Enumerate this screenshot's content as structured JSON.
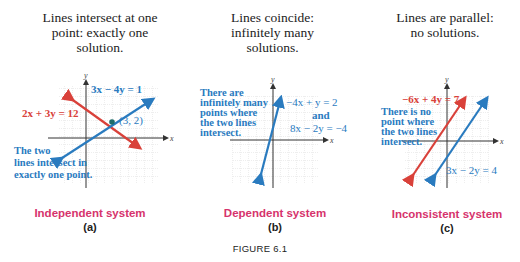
{
  "colors": {
    "red_line": "#d9413a",
    "blue_line": "#2a7bbf",
    "label_magenta": "#d6336c",
    "grid": "#bbbbbb",
    "text": "#222222"
  },
  "panels": [
    {
      "id": "a",
      "caption_lines": [
        "Lines intersect at one",
        "point: exactly one",
        "solution."
      ],
      "system_label": "Independent system",
      "sub_label": "(a)",
      "equations": [
        {
          "text": "3x − 4y = 1",
          "color": "blue"
        },
        {
          "text": "2x + 3y = 12",
          "color": "red"
        }
      ],
      "point_label": "(3, 2)",
      "note_lines": [
        "The two",
        "lines intersect in",
        "exactly one point."
      ],
      "axis_x": "x",
      "axis_y": "y"
    },
    {
      "id": "b",
      "caption_lines": [
        "Lines coincide:",
        "infinitely many",
        "solutions."
      ],
      "system_label": "Dependent system",
      "sub_label": "(b)",
      "equations": [
        {
          "text": "−4x + y = 2",
          "color": "blue"
        },
        {
          "text": "and",
          "color": "blue"
        },
        {
          "text": "8x − 2y = −4",
          "color": "blue"
        }
      ],
      "note_lines": [
        "There are",
        "infinitely many",
        "points where",
        "the two lines",
        "intersect."
      ],
      "axis_x": "x",
      "axis_y": "y"
    },
    {
      "id": "c",
      "caption_lines": [
        "Lines are parallel:",
        "no solutions."
      ],
      "system_label": "Inconsistent system",
      "sub_label": "(c)",
      "equations": [
        {
          "text": "−6x + 4y = 7",
          "color": "red"
        },
        {
          "text": "3x − 2y = 4",
          "color": "blue"
        }
      ],
      "note_lines": [
        "There is no",
        "point where",
        "the two lines",
        "intersect."
      ],
      "axis_x": "x",
      "axis_y": "y"
    }
  ],
  "figure_label": "FIGURE 6.1"
}
